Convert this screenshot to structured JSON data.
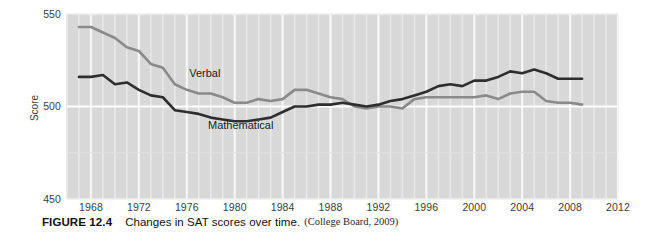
{
  "figure": {
    "number_label": "FIGURE 12.4",
    "title": "Changes in SAT scores over time.",
    "source": "(College Board, 2009)"
  },
  "chart_data": {
    "type": "line",
    "title": "Changes in SAT scores over time.",
    "xlabel": "",
    "ylabel": "Score",
    "xlim": [
      1966,
      2012
    ],
    "ylim": [
      450,
      550
    ],
    "yticks": [
      450,
      500,
      550
    ],
    "ytick_labels": [
      "450",
      "500",
      "550"
    ],
    "xticks": [
      1968,
      1972,
      1976,
      1980,
      1984,
      1988,
      1992,
      1996,
      2000,
      2004,
      2008,
      2012
    ],
    "xtick_labels": [
      "1968",
      "1972",
      "1976",
      "1980",
      "1984",
      "1988",
      "1992",
      "1996",
      "2000",
      "2004",
      "2008",
      "2012"
    ],
    "grid": true,
    "grid_orientation": "vertical-minor-yearly",
    "plot_background": "#d8d8d8",
    "legend": "inline-labels",
    "series": [
      {
        "name": "Verbal",
        "color": "#8a8a8a",
        "label_position": {
          "x": 1977.5,
          "y": 516
        },
        "x": [
          1967,
          1968,
          1969,
          1970,
          1971,
          1972,
          1973,
          1974,
          1975,
          1976,
          1977,
          1978,
          1979,
          1980,
          1981,
          1982,
          1983,
          1984,
          1985,
          1986,
          1987,
          1988,
          1989,
          1990,
          1991,
          1992,
          1993,
          1994,
          1995,
          1996,
          1997,
          1998,
          1999,
          2000,
          2001,
          2002,
          2003,
          2004,
          2005,
          2006,
          2007,
          2008,
          2009
        ],
        "values": [
          543,
          543,
          540,
          537,
          532,
          530,
          523,
          521,
          512,
          509,
          507,
          507,
          505,
          502,
          502,
          504,
          503,
          504,
          509,
          509,
          507,
          505,
          504,
          500,
          499,
          500,
          500,
          499,
          504,
          505,
          505,
          505,
          505,
          505,
          506,
          504,
          507,
          508,
          508,
          503,
          502,
          502,
          501
        ]
      },
      {
        "name": "Mathematical",
        "color": "#2e2e2e",
        "label_position": {
          "x": 1980.5,
          "y": 488
        },
        "x": [
          1967,
          1968,
          1969,
          1970,
          1971,
          1972,
          1973,
          1974,
          1975,
          1976,
          1977,
          1978,
          1979,
          1980,
          1981,
          1982,
          1983,
          1984,
          1985,
          1986,
          1987,
          1988,
          1989,
          1990,
          1991,
          1992,
          1993,
          1994,
          1995,
          1996,
          1997,
          1998,
          1999,
          2000,
          2001,
          2002,
          2003,
          2004,
          2005,
          2006,
          2007,
          2008,
          2009
        ],
        "values": [
          516,
          516,
          517,
          512,
          513,
          509,
          506,
          505,
          498,
          497,
          496,
          494,
          493,
          492,
          492,
          493,
          494,
          497,
          500,
          500,
          501,
          501,
          502,
          501,
          500,
          501,
          503,
          504,
          506,
          508,
          511,
          512,
          511,
          514,
          514,
          516,
          519,
          518,
          520,
          518,
          515,
          515,
          515
        ]
      }
    ]
  },
  "axes": {
    "y_title": "Score"
  }
}
